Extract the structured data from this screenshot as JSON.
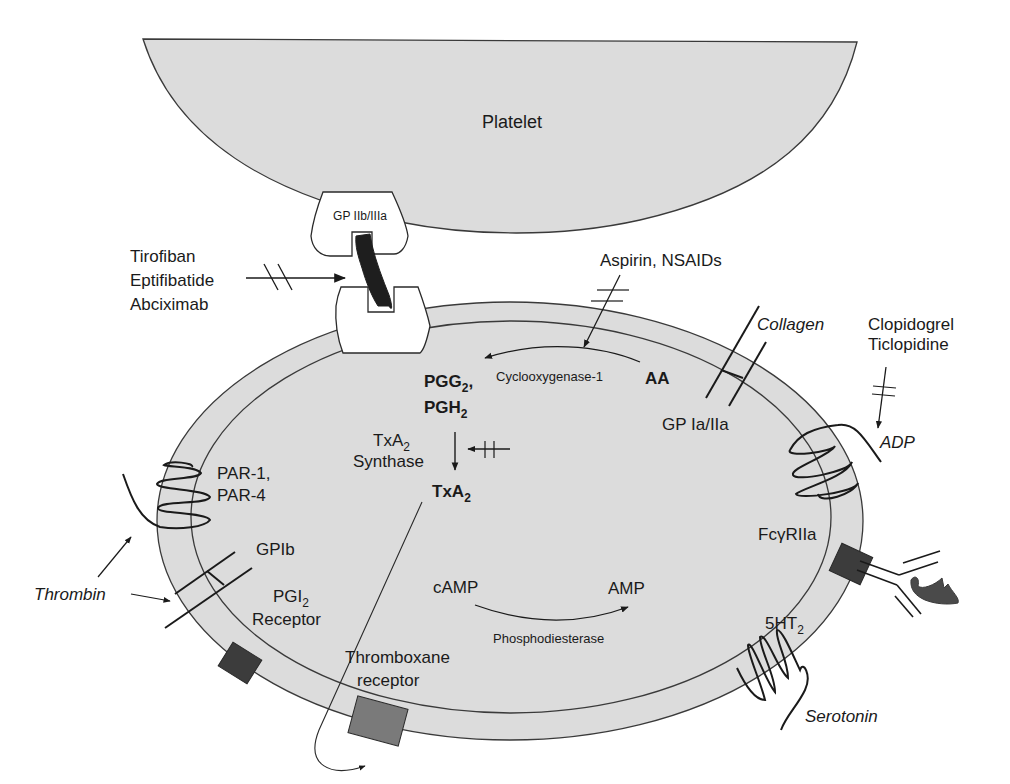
{
  "colors": {
    "cell_fill": "#dcdcdc",
    "outline": "#3a3a3a",
    "receptor_dark": "#3c3c3c",
    "receptor_mid": "#7a7a7a",
    "fibrinogen": "#1e1e1e",
    "receptor_white": "#ffffff"
  },
  "platelet_top": {
    "label": "Platelet"
  },
  "gp2b3a": {
    "label": "GP IIb/IIIa",
    "inhibitors": [
      "Tirofiban",
      "Eptifibatide",
      "Abciximab"
    ]
  },
  "aspirin": {
    "label": "Aspirin, NSAIDs"
  },
  "cox_pathway": {
    "substrate": "AA",
    "enzyme": "Cyclooxygenase-1",
    "product_1": "PGG",
    "product_1_sub": "2",
    "product_1_suffix": ",",
    "product_2": "PGH",
    "product_2_sub": "2"
  },
  "txa2_pathway": {
    "enzyme_line1": "TxA",
    "enzyme_line1_sub": "2",
    "enzyme_line2": "Synthase",
    "product": "TxA",
    "product_sub": "2"
  },
  "collagen": {
    "ligand": "Collagen",
    "receptor": "GP Ia/IIa"
  },
  "adp": {
    "inhibitors": [
      "Clopidogrel",
      "Ticlopidine"
    ],
    "ligand": "ADP"
  },
  "par": {
    "line1": "PAR-1,",
    "line2": "PAR-4"
  },
  "gp1b": {
    "label": "GPIb"
  },
  "thrombin": {
    "label": "Thrombin"
  },
  "pgi2": {
    "line1": "PGI",
    "line1_sub": "2",
    "line2": "Receptor"
  },
  "camp": {
    "substrate": "cAMP",
    "product": "AMP",
    "enzyme": "Phosphodiesterase"
  },
  "thromboxane_receptor": {
    "line1": "Thromboxane",
    "line2": "receptor"
  },
  "fcgamma": {
    "label": "FcγRIIa"
  },
  "serotonin": {
    "receptor": "5HT",
    "receptor_sub": "2",
    "ligand": "Serotonin"
  }
}
